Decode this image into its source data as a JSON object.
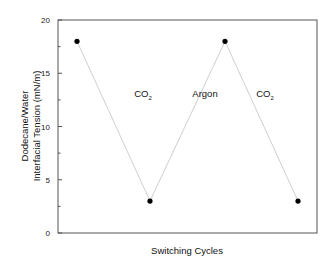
{
  "chart_data": {
    "type": "line",
    "title": "",
    "xlabel": "Switching Cycles",
    "ylabel": [
      "Dodecane/Water",
      "Interfacial Tension (mN/m)"
    ],
    "ylim": [
      0,
      20
    ],
    "yticks": [
      0,
      5,
      10,
      15,
      20
    ],
    "grid": false,
    "x": [
      1,
      2,
      3,
      4
    ],
    "series": [
      {
        "name": "Interfacial Tension",
        "values": [
          18,
          3,
          18,
          3
        ],
        "marker": "circle",
        "line_color": "#c8c8c8",
        "marker_color": "#000000"
      }
    ],
    "annotations": [
      {
        "text": "CO",
        "sub": "2",
        "between": [
          1,
          2
        ]
      },
      {
        "text": "Argon",
        "sub": "",
        "between": [
          2,
          3
        ]
      },
      {
        "text": "CO",
        "sub": "2",
        "between": [
          3,
          4
        ]
      }
    ]
  }
}
